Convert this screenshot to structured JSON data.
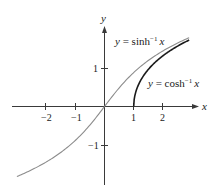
{
  "chart_data": {
    "type": "line",
    "title": "",
    "xlabel": "x",
    "ylabel": "y",
    "xlim": [
      -3.0,
      3.0
    ],
    "ylim": [
      -2.0,
      2.1
    ],
    "grid": false,
    "x_ticks": [
      -2,
      -1,
      1,
      2
    ],
    "x_tick_labels": [
      "−2",
      "−1",
      "1",
      "2"
    ],
    "y_ticks": [
      1,
      -1
    ],
    "y_tick_labels": [
      "1",
      "−1"
    ],
    "series": [
      {
        "name": "y = sinh⁻¹ x",
        "color": "#8c8c8c",
        "function": "asinh",
        "domain": [
          -3.0,
          2.9
        ],
        "x": [
          -3,
          -2,
          -1,
          0,
          1,
          2,
          2.9
        ],
        "values": [
          -1.818,
          -1.444,
          -0.881,
          0,
          0.881,
          1.444,
          1.783
        ]
      },
      {
        "name": "y = cosh⁻¹ x",
        "color": "#1a1a1a",
        "function": "acosh",
        "domain": [
          1.0,
          2.9
        ],
        "x": [
          1,
          1.5,
          2,
          2.5,
          2.9
        ],
        "values": [
          0,
          0.962,
          1.317,
          1.567,
          1.723
        ]
      }
    ],
    "annotations": [
      {
        "text": "y = sinh⁻¹ x",
        "target": "sinh"
      },
      {
        "text": "y = cosh⁻¹ x",
        "target": "cosh"
      }
    ]
  },
  "labels": {
    "x_axis": "x",
    "y_axis": "y",
    "sinh_prefix": "y = sinh",
    "sinh_sup": "−1",
    "sinh_var": "x",
    "cosh_prefix": "y = cosh",
    "cosh_sup": "−1",
    "cosh_var": "x",
    "tick_xm2": "−2",
    "tick_xm1": "−1",
    "tick_x1": "1",
    "tick_x2": "2",
    "tick_y1": "1",
    "tick_ym1": "−1"
  }
}
